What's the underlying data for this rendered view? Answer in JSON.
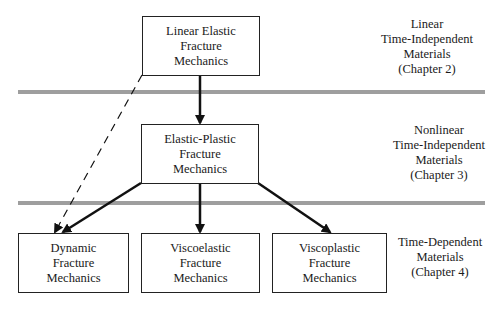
{
  "nodes": {
    "lefm": {
      "lines": [
        "Linear Elastic",
        "Fracture",
        "Mechanics"
      ]
    },
    "epfm": {
      "lines": [
        "Elastic-Plastic",
        "Fracture",
        "Mechanics"
      ]
    },
    "dynamic": {
      "lines": [
        "Dynamic",
        "Fracture",
        "Mechanics"
      ]
    },
    "viscoelastic": {
      "lines": [
        "Viscoelastic",
        "Fracture",
        "Mechanics"
      ]
    },
    "viscoplastic": {
      "lines": [
        "Viscoplastic",
        "Fracture",
        "Mechanics"
      ]
    }
  },
  "regions": [
    {
      "lines": [
        "Linear",
        "Time-Independent",
        "Materials",
        "(Chapter 2)"
      ]
    },
    {
      "lines": [
        "Nonlinear",
        "Time-Independent",
        "Materials",
        "(Chapter 3)"
      ]
    },
    {
      "lines": [
        "Time-Dependent",
        "Materials",
        "(Chapter 4)"
      ]
    }
  ],
  "edges": [
    {
      "from": "lefm",
      "to": "epfm",
      "style": "solid"
    },
    {
      "from": "lefm",
      "to": "dynamic",
      "style": "dashed"
    },
    {
      "from": "epfm",
      "to": "dynamic",
      "style": "solid"
    },
    {
      "from": "epfm",
      "to": "viscoelastic",
      "style": "solid"
    },
    {
      "from": "epfm",
      "to": "viscoplastic",
      "style": "solid"
    }
  ],
  "colors": {
    "separator": "#9e9e9e",
    "line": "#111111"
  }
}
